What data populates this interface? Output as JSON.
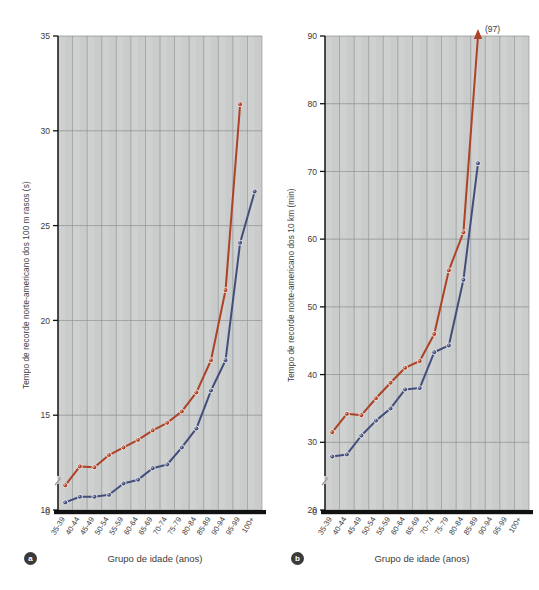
{
  "figure": {
    "panels": [
      {
        "tag": "a",
        "xlabel": "Grupo de idade (anos)",
        "ylabel": "Tempo de recorde norte-americano dos 100 m rasos (s)"
      },
      {
        "tag": "b",
        "xlabel": "Grupo de idade (anos)",
        "ylabel": "Tempo de recorde norte-americano dos 10 km (min)"
      }
    ]
  },
  "colors": {
    "series_women": "#ad4226",
    "series_men": "#434e7d",
    "plot_background": "#c9ccca",
    "gridline": "#8d918f",
    "axis": "#111111",
    "text": "#3c3c3c"
  },
  "chart_data": [
    {
      "type": "line",
      "title": "",
      "panel_tag": "a",
      "xlabel": "Grupo de idade (anos)",
      "ylabel": "Tempo de recorde norte-americano dos 100 m rasos (s)",
      "categories": [
        "35-39",
        "40-44",
        "45-49",
        "50-54",
        "55-59",
        "60-64",
        "65-69",
        "70-74",
        "75-79",
        "80-84",
        "85-89",
        "90-94",
        "95-99",
        "100+"
      ],
      "yticks": [
        0,
        10,
        15,
        20,
        25,
        30,
        35
      ],
      "ylim": [
        10,
        35
      ],
      "y_axis_break": true,
      "grid": "both",
      "legend": "none",
      "series": [
        {
          "name": "Mulheres",
          "color": "#ad4226",
          "values": [
            11.3,
            12.3,
            12.25,
            12.9,
            13.3,
            13.7,
            14.2,
            14.6,
            15.2,
            16.2,
            17.9,
            21.6,
            31.4,
            null
          ]
        },
        {
          "name": "Homens",
          "color": "#434e7d",
          "values": [
            10.4,
            10.7,
            10.7,
            10.8,
            11.4,
            11.6,
            12.2,
            12.4,
            13.3,
            14.3,
            16.3,
            17.9,
            24.1,
            26.8
          ]
        }
      ]
    },
    {
      "type": "line",
      "title": "",
      "panel_tag": "b",
      "xlabel": "Grupo de idade (anos)",
      "ylabel": "Tempo de recorde norte-americano dos 10 km (min)",
      "categories": [
        "35-39",
        "40-44",
        "45-49",
        "50-54",
        "55-59",
        "60-64",
        "65-69",
        "70-74",
        "75-79",
        "80-84",
        "85-89",
        "90-94",
        "95-99",
        "100+"
      ],
      "yticks": [
        0,
        20,
        30,
        40,
        50,
        60,
        70,
        80,
        90
      ],
      "ylim": [
        20,
        90
      ],
      "y_axis_break": true,
      "grid": "both",
      "legend": "none",
      "annotations": [
        {
          "text": "(97)",
          "category": "90-94",
          "note": "arrow above axis: value off-scale at 97 min"
        }
      ],
      "series": [
        {
          "name": "Mulheres",
          "color": "#ad4226",
          "values": [
            31.5,
            34.2,
            34.0,
            36.5,
            38.8,
            41.0,
            42.0,
            46.0,
            55.4,
            61.0,
            97.0,
            null,
            null,
            null
          ]
        },
        {
          "name": "Homens",
          "color": "#434e7d",
          "values": [
            27.9,
            28.2,
            31.0,
            33.2,
            35.0,
            37.8,
            38.0,
            43.3,
            44.3,
            54.0,
            71.2,
            null,
            null,
            null
          ]
        }
      ]
    }
  ]
}
